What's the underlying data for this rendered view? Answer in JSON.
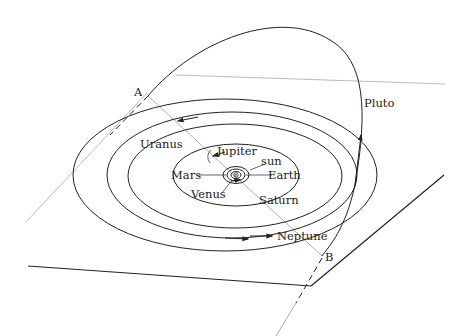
{
  "diagram": {
    "type": "solar-system-orbit-diagram",
    "colors": {
      "ink": "#222222",
      "plane_line": "#999999",
      "background": "#ffffff"
    },
    "center": {
      "label": "sun"
    },
    "planets": [
      {
        "name": "Mars",
        "label": "Mars"
      },
      {
        "name": "Earth",
        "label": "Earth"
      },
      {
        "name": "Venus",
        "label": "Venus"
      },
      {
        "name": "Jupiter",
        "label": "Jupiter"
      },
      {
        "name": "Saturn",
        "label": "Saturn"
      },
      {
        "name": "Uranus",
        "label": "Uranus"
      },
      {
        "name": "Neptune",
        "label": "Neptune"
      },
      {
        "name": "Pluto",
        "label": "Pluto"
      }
    ],
    "points": [
      {
        "name": "A",
        "label": "A"
      },
      {
        "name": "B",
        "label": "B"
      }
    ]
  }
}
